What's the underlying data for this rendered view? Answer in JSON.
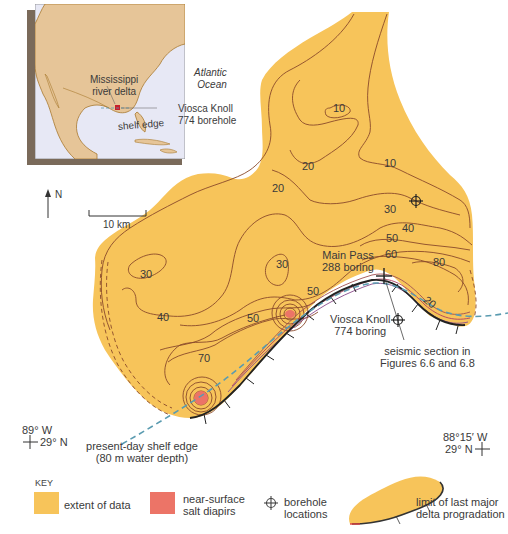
{
  "inset_map": {
    "labels": {
      "mississippi": [
        "Mississippi",
        "river delta"
      ],
      "atlantic": [
        "Atlantic",
        "Ocean"
      ],
      "viosca": [
        "Viosca Knoll",
        "774 borehole"
      ],
      "shelf_edge": "shelf edge"
    },
    "colors": {
      "land": "#e6c598",
      "ocean": "#e7e8f5",
      "frame_shadow": "#7a6a5a",
      "border": "#a8782e"
    }
  },
  "north_arrow": {
    "label": "N"
  },
  "scale_bar": {
    "label": "10 km"
  },
  "contours": {
    "labels": [
      "10",
      "10",
      "20",
      "20",
      "10",
      "30",
      "40",
      "50",
      "60",
      "80",
      "20",
      "20",
      "30",
      "30",
      "40",
      "50",
      "50",
      "70"
    ],
    "colors": {
      "fill": "#f7c45a",
      "line": "#8a4a2a",
      "diapir": "#ec7467",
      "shelf_edge": "#5a9bb0"
    }
  },
  "boreholes": {
    "main_pass": [
      "Main Pass",
      "288 boring"
    ],
    "viosca": [
      "Viosca Knoll",
      "774 boring"
    ],
    "seismic": [
      "seismic section in",
      "Figures 6.6 and 6.8"
    ]
  },
  "coordinates": {
    "sw": {
      "lon": "89° W",
      "lat": "29° N"
    },
    "se": {
      "lon": "88°15′ W",
      "lat": "29° N"
    }
  },
  "shelf_edge_label": [
    "present-day shelf edge",
    "(80 m water depth)"
  ],
  "key": {
    "title": "KEY",
    "items": [
      {
        "label": "extent of data",
        "color": "#f7c45a"
      },
      {
        "label": [
          "near-surface",
          "salt diapirs"
        ],
        "color": "#ec7467"
      },
      {
        "label": [
          "borehole",
          "locations"
        ]
      },
      {
        "label": [
          "limit of last major",
          "delta progradation"
        ]
      }
    ]
  }
}
